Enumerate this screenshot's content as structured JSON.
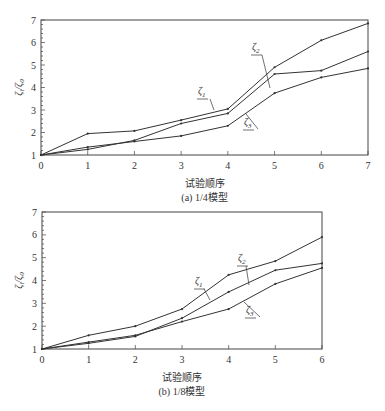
{
  "chart_data": [
    {
      "type": "line",
      "id": "a",
      "caption": "(a)  1/4模型",
      "xlabel": "试验顺序",
      "ylabel": "ζi/ζ0",
      "ylabel_main": "ζ",
      "ylabel_sub": "i",
      "ylabel_den": "ζ",
      "ylabel_den_sub": "0",
      "x": [
        0,
        1,
        2,
        3,
        4,
        5,
        6,
        7
      ],
      "xlim": [
        0,
        7
      ],
      "ylim": [
        1,
        7
      ],
      "xticks": [
        "0",
        "1",
        "2",
        "3",
        "4",
        "5",
        "6",
        "7"
      ],
      "yticks": [
        "1",
        "2",
        "3",
        "4",
        "5",
        "6",
        "7"
      ],
      "grid": false,
      "legend": "inline leader labels",
      "series": [
        {
          "name": "ζ1",
          "label_main": "ζ",
          "label_sub": "1",
          "values": [
            1.0,
            1.95,
            2.07,
            2.55,
            3.05,
            4.9,
            6.1,
            6.85
          ]
        },
        {
          "name": "ζ2",
          "label_main": "ζ",
          "label_sub": "2",
          "values": [
            1.0,
            1.25,
            1.65,
            2.4,
            2.85,
            4.6,
            4.75,
            5.6
          ]
        },
        {
          "name": "ζ3",
          "label_main": "ζ",
          "label_sub": "3",
          "values": [
            1.0,
            1.35,
            1.6,
            1.85,
            2.3,
            3.75,
            4.45,
            4.85
          ]
        }
      ]
    },
    {
      "type": "line",
      "id": "b",
      "caption": "(b)  1/8模型",
      "xlabel": "试验顺序",
      "ylabel": "ζi/ζ0",
      "ylabel_main": "ζ",
      "ylabel_sub": "i",
      "ylabel_den": "ζ",
      "ylabel_den_sub": "0",
      "x": [
        0,
        1,
        2,
        3,
        4,
        5,
        6
      ],
      "xlim": [
        0,
        6
      ],
      "ylim": [
        1,
        7
      ],
      "xticks": [
        "0",
        "1",
        "2",
        "3",
        "4",
        "5",
        "6"
      ],
      "yticks": [
        "1",
        "2",
        "3",
        "4",
        "5",
        "6",
        "7"
      ],
      "grid": false,
      "legend": "inline leader labels",
      "series": [
        {
          "name": "ζ1",
          "label_main": "ζ",
          "label_sub": "1",
          "values": [
            1.0,
            1.6,
            2.0,
            2.75,
            4.25,
            4.85,
            5.9
          ]
        },
        {
          "name": "ζ2",
          "label_main": "ζ",
          "label_sub": "2",
          "values": [
            1.0,
            1.25,
            1.55,
            2.35,
            3.5,
            4.45,
            4.75
          ]
        },
        {
          "name": "ζ3",
          "label_main": "ζ",
          "label_sub": "3",
          "values": [
            1.0,
            1.3,
            1.6,
            2.2,
            2.75,
            3.85,
            4.55
          ]
        }
      ]
    }
  ],
  "style": {
    "line_color": "#333333",
    "axis_color": "#444444",
    "background": "#ffffff"
  }
}
